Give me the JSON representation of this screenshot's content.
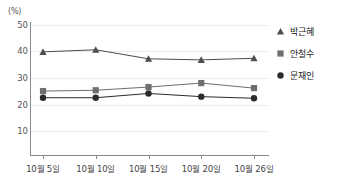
{
  "chart_data": {
    "type": "line",
    "title": "",
    "xlabel": "",
    "ylabel": "(%)",
    "ylim": [
      0,
      50
    ],
    "yticks": [
      50,
      40,
      30,
      20,
      10
    ],
    "grid": true,
    "legend_position": "right",
    "categories": [
      "10월 5일",
      "10월 10일",
      "10월 15일",
      "10월 20일",
      "10월 26일"
    ],
    "series": [
      {
        "name": "박근혜",
        "marker": "triangle",
        "color": "#4d4d4d",
        "values": [
          39.8,
          40.6,
          37.2,
          36.8,
          37.4
        ]
      },
      {
        "name": "안철수",
        "marker": "square",
        "color": "#6e6e6e",
        "values": [
          25.1,
          25.4,
          26.6,
          28.1,
          26.2
        ]
      },
      {
        "name": "문재인",
        "marker": "circle",
        "color": "#2b2b2b",
        "values": [
          22.6,
          22.6,
          24.2,
          23.0,
          22.4
        ]
      }
    ]
  },
  "axis": {
    "unit_label": "(%)",
    "tick_labels_y": [
      "50",
      "40",
      "30",
      "20",
      "10"
    ],
    "tick_labels_x": [
      "10월 5일",
      "10월 10일",
      "10월 15일",
      "10월 20일",
      "10월 26일"
    ]
  },
  "legend": {
    "items": [
      {
        "label": "박근혜",
        "marker": "triangle-marker-icon",
        "color": "#4d4d4d"
      },
      {
        "label": "안철수",
        "marker": "square-marker-icon",
        "color": "#6e6e6e"
      },
      {
        "label": "문재인",
        "marker": "circle-marker-icon",
        "color": "#2b2b2b"
      }
    ]
  },
  "colors": {
    "axis": "#8a8a8a",
    "grid": "#ececec",
    "text": "#444444",
    "background": "#ffffff"
  }
}
